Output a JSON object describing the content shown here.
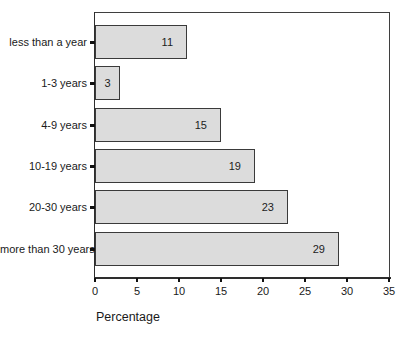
{
  "chart_data": {
    "type": "bar",
    "orientation": "horizontal",
    "title": "",
    "xlabel": "Percentage",
    "ylabel": "",
    "categories": [
      "less than a year",
      "1-3 years",
      "4-9 years",
      "10-19 years",
      "20-30 years",
      "more than 30 years"
    ],
    "values": [
      11,
      3,
      15,
      19,
      23,
      29
    ],
    "xlim": [
      0,
      35
    ],
    "x_ticks": [
      0,
      5,
      10,
      15,
      20,
      25,
      30,
      35
    ],
    "grid": false,
    "legend": false,
    "bar_fill_color": "#dcdcdc",
    "bar_border_color": "#3a3a3a",
    "axis_color": "#2e2e2e",
    "text_color": "#1a1a1a"
  }
}
